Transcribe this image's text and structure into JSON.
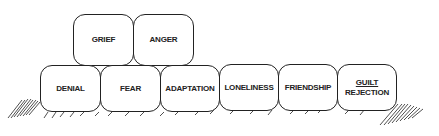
{
  "diagram": {
    "type": "stacked blocks",
    "top_row": [
      {
        "label": "GRIEF"
      },
      {
        "label": "ANGER"
      }
    ],
    "bottom_row": [
      {
        "label": "DENIAL"
      },
      {
        "label": "FEAR"
      },
      {
        "label": "ADAPTATION"
      },
      {
        "label": "LONELINESS"
      },
      {
        "label": "FRIENDSHIP"
      },
      {
        "label": "GUILT",
        "label2": "REJECTION"
      }
    ]
  }
}
